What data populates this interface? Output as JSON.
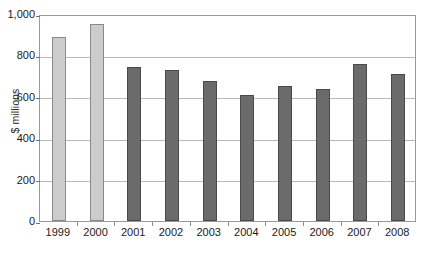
{
  "chart_data": {
    "type": "bar",
    "title": "",
    "subtitle": "",
    "xlabel": "",
    "ylabel": "$ millions",
    "categories": [
      "1999",
      "2000",
      "2001",
      "2002",
      "2003",
      "2004",
      "2005",
      "2006",
      "2007",
      "2008"
    ],
    "values": [
      890,
      950,
      742,
      730,
      678,
      610,
      650,
      640,
      760,
      712
    ],
    "bar_colors": [
      "#cccccc",
      "#cccccc",
      "#6b6b6b",
      "#6b6b6b",
      "#6b6b6b",
      "#6b6b6b",
      "#6b6b6b",
      "#6b6b6b",
      "#6b6b6b",
      "#6b6b6b"
    ],
    "bar_styles": [
      "light",
      "light",
      "dark",
      "dark",
      "dark",
      "dark",
      "dark",
      "dark",
      "dark",
      "dark"
    ],
    "ylim": [
      0,
      1000
    ],
    "ytick_values": [
      0,
      200,
      400,
      600,
      800,
      1000
    ],
    "ytick_labels": [
      "0",
      "200",
      "400",
      "600",
      "800",
      "1,000"
    ],
    "grid": true,
    "grid_axis": "y",
    "legend": false,
    "legend_position": "none",
    "frame": true,
    "annotations": []
  },
  "colors": {
    "light_bar": "#cccccc",
    "light_bar_border": "#8a8a8a",
    "dark_bar": "#6b6b6b",
    "dark_bar_border": "#4a4a4a",
    "gridline": "#b9b9b9",
    "frame": "#9a9a9a",
    "text": "#1a1a1a",
    "background": "#ffffff"
  }
}
